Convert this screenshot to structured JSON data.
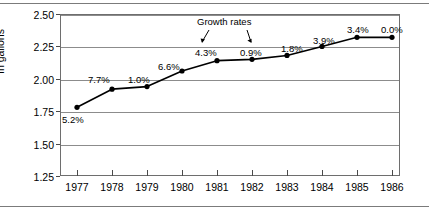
{
  "chart_data": {
    "type": "line",
    "title": "",
    "xlabel": "",
    "ylabel": "In gallons",
    "categories": [
      "1977",
      "1978",
      "1979",
      "1980",
      "1981",
      "1982",
      "1983",
      "1984",
      "1985",
      "1986"
    ],
    "values": [
      1.78,
      1.92,
      1.94,
      2.06,
      2.14,
      2.15,
      2.18,
      2.25,
      2.32,
      2.32
    ],
    "ylim": [
      1.25,
      2.5
    ],
    "yticks": [
      "1.25",
      "1.50",
      "1.75",
      "2.00",
      "2.25",
      "2.50"
    ],
    "ytick_values": [
      1.25,
      1.5,
      1.75,
      2.0,
      2.25,
      2.5
    ],
    "grid": true,
    "legend": "none",
    "marker": "filled-circle",
    "line_color": "#000000",
    "point_labels": [
      "5.2%",
      "7.7%",
      "1.0%",
      "6.6%",
      "4.3%",
      "0.9%",
      "1.8%",
      "3.9%",
      "3.4%",
      "0.0%"
    ],
    "annotations": [
      {
        "text": "Growth rates",
        "targets": [
          "4.3%",
          "0.9%"
        ]
      }
    ]
  },
  "axes": {
    "y_title": "In gallons"
  }
}
